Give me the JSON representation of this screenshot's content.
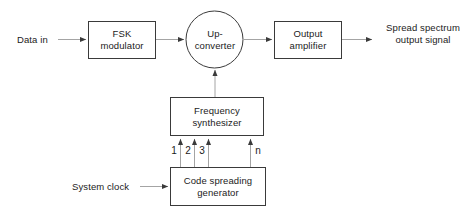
{
  "diagram": {
    "stroke_color": "#3a3a3a",
    "text_color": "#1b1b1b",
    "background_color": "#ffffff"
  },
  "blocks": {
    "fsk_modulator": {
      "label": "FSK\nmodulator",
      "shape": "rect"
    },
    "up_converter": {
      "label": "Up-\nconverter",
      "shape": "circle"
    },
    "output_amplifier": {
      "label": "Output\namplifier",
      "shape": "rect"
    },
    "frequency_synthesizer": {
      "label": "Frequency\nsynthesizer",
      "shape": "rect"
    },
    "code_spreading_generator": {
      "label": "Code spreading\ngenerator",
      "shape": "rect"
    }
  },
  "labels": {
    "data_in": "Data in",
    "spread_spectrum_output": "Spread spectrum\noutput signal",
    "system_clock": "System clock"
  },
  "bus_taps": [
    {
      "label": "1"
    },
    {
      "label": "2"
    },
    {
      "label": "3"
    },
    {
      "label": "n"
    }
  ]
}
